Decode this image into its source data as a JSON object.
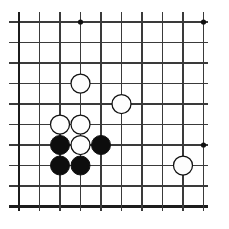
{
  "figure": {
    "title": "Go board position diagram",
    "kind": "go-board-diagram"
  },
  "board": {
    "label": "go-board",
    "visible_columns": 10,
    "visible_rows": 10,
    "cell_size": 20.5,
    "origin_x": 19,
    "origin_y": 22,
    "line_color": "#3a3a3a",
    "edge_color": "#1c1c1c",
    "background_color": "#ffffff",
    "stone_radius": 9.5,
    "star_radius": 2.6,
    "star_points": [
      {
        "name": "star-point-d4",
        "col": 4,
        "row": 1
      },
      {
        "name": "star-point-k4",
        "col": 10,
        "row": 1
      },
      {
        "name": "star-point-k10",
        "col": 10,
        "row": 7
      }
    ],
    "columns": [
      1,
      2,
      3,
      4,
      5,
      6,
      7,
      8,
      9,
      10
    ],
    "rows": [
      1,
      2,
      3,
      4,
      5,
      6,
      7,
      8,
      9,
      10
    ]
  },
  "stones": [
    {
      "name": "white-stone-1",
      "color": "white",
      "col": 4,
      "row": 4
    },
    {
      "name": "white-stone-2",
      "color": "white",
      "col": 6,
      "row": 5
    },
    {
      "name": "white-stone-3",
      "color": "white",
      "col": 3,
      "row": 6
    },
    {
      "name": "white-stone-4",
      "color": "white",
      "col": 4,
      "row": 6
    },
    {
      "name": "black-stone-1",
      "color": "black",
      "col": 3,
      "row": 7
    },
    {
      "name": "white-stone-5",
      "color": "white",
      "col": 4,
      "row": 7
    },
    {
      "name": "black-stone-2",
      "color": "black",
      "col": 5,
      "row": 7
    },
    {
      "name": "black-stone-3",
      "color": "black",
      "col": 3,
      "row": 8
    },
    {
      "name": "black-stone-4",
      "color": "black",
      "col": 4,
      "row": 8
    },
    {
      "name": "white-stone-6",
      "color": "white",
      "col": 9,
      "row": 8
    }
  ],
  "counts": {
    "black_stones": 4,
    "white_stones": 6,
    "total_stones": 10
  }
}
